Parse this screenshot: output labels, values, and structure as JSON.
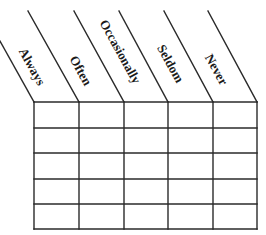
{
  "figure": {
    "type": "frequency-response-grid",
    "line_color": "#2a2a2a",
    "background": "#ffffff"
  },
  "header": {
    "rotation_deg": 61,
    "columns": [
      {
        "label": "Always",
        "center": [
          32,
          66
        ]
      },
      {
        "label": "Often",
        "center": [
          81,
          70
        ]
      },
      {
        "label": "Occasionally",
        "center": [
          120,
          51
        ]
      },
      {
        "label": "Seldom",
        "center": [
          170,
          63
        ]
      },
      {
        "label": "Never",
        "center": [
          216,
          69
        ]
      }
    ]
  },
  "grid": {
    "left": 34,
    "top": 102,
    "right": 257,
    "bottom": 229,
    "column_x": [
      34,
      79,
      124,
      168,
      213,
      257
    ],
    "row_y": [
      102,
      128,
      153,
      179,
      204,
      229
    ],
    "rows": 5,
    "cells": [
      [
        "",
        "",
        "",
        "",
        ""
      ],
      [
        "",
        "",
        "",
        "",
        ""
      ],
      [
        "",
        "",
        "",
        "",
        ""
      ],
      [
        "",
        "",
        "",
        "",
        ""
      ],
      [
        "",
        "",
        "",
        "",
        ""
      ]
    ]
  },
  "diagonals": [
    {
      "x1": 0,
      "y1": 41,
      "x2": 34,
      "y2": 102
    },
    {
      "x1": 28,
      "y1": 11,
      "x2": 79,
      "y2": 102
    },
    {
      "x1": 74,
      "y1": 11,
      "x2": 124,
      "y2": 102
    },
    {
      "x1": 119,
      "y1": 11,
      "x2": 168,
      "y2": 102
    },
    {
      "x1": 164,
      "y1": 11,
      "x2": 213,
      "y2": 102
    },
    {
      "x1": 208,
      "y1": 11,
      "x2": 257,
      "y2": 102
    }
  ]
}
